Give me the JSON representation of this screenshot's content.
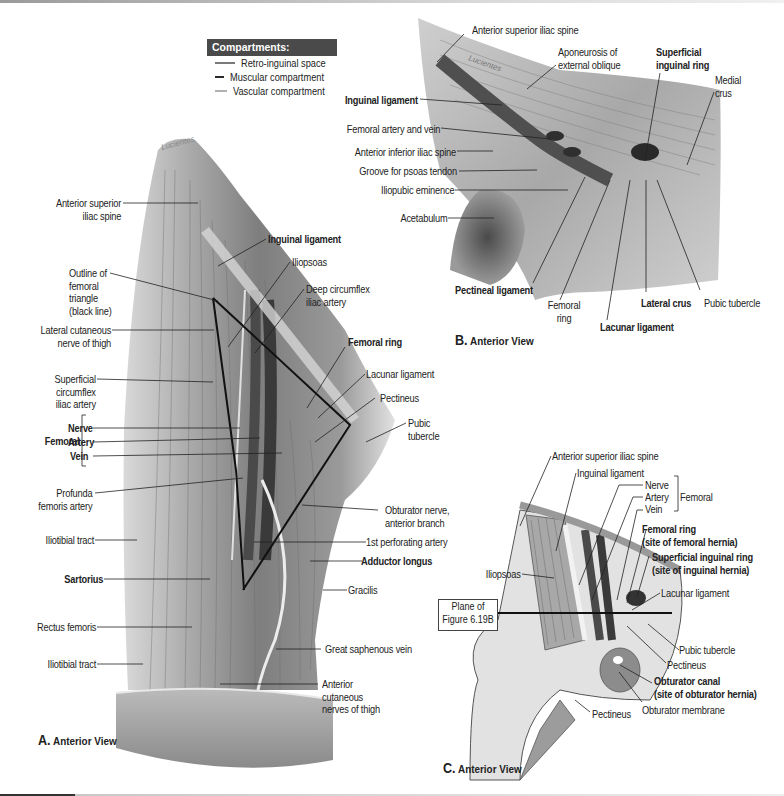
{
  "legend": {
    "title": "Compartments:",
    "items": [
      {
        "label": "Retro-inguinal space",
        "color": "#7a7a7a"
      },
      {
        "label": "Muscular compartment",
        "color": "#2a2a2a"
      },
      {
        "label": "Vascular compartment",
        "color": "#b0b0b0"
      }
    ]
  },
  "panel_a": {
    "caption_letter": "A.",
    "caption_text": "Anterior View",
    "labels_left": [
      {
        "text": "Anterior superior",
        "text2": "iliac spine"
      },
      {
        "text": "Outline of",
        "text2": "femoral",
        "text3": "triangle",
        "text4": "(black line)"
      },
      {
        "text": "Lateral cutaneous",
        "text2": "nerve of thigh"
      },
      {
        "text": "Superficial",
        "text2": "circumflex",
        "text3": "iliac artery"
      },
      {
        "text": "Profunda",
        "text2": "femoris artery"
      },
      {
        "text": "Iliotibial tract"
      },
      {
        "text": "Sartorius"
      },
      {
        "text": "Rectus femoris"
      },
      {
        "text": "Iliotibial tract"
      }
    ],
    "femoral_group": {
      "title": "Femoral",
      "nerve": "Nerve",
      "artery": "Artery",
      "vein": "Vein"
    },
    "labels_right": [
      {
        "text": "Inguinal ligament"
      },
      {
        "text": "Iliopsoas"
      },
      {
        "text": "Deep circumflex",
        "text2": "iliac artery"
      },
      {
        "text": "Femoral ring"
      },
      {
        "text": "Lacunar ligament"
      },
      {
        "text": "Pectineus"
      },
      {
        "text": "Pubic",
        "text2": "tubercle"
      },
      {
        "text": "Obturator nerve,",
        "text2": "anterior branch"
      },
      {
        "text": "1st perforating artery"
      },
      {
        "text": "Adductor longus"
      },
      {
        "text": "Gracilis"
      },
      {
        "text": "Great saphenous vein"
      },
      {
        "text": "Anterior",
        "text2": "cutaneous",
        "text3": "nerves of thigh"
      }
    ]
  },
  "panel_b": {
    "caption_letter": "B.",
    "caption_text": "Anterior View",
    "labels": [
      {
        "text": "Anterior superior iliac spine"
      },
      {
        "text": "Aponeurosis of",
        "text2": "external oblique"
      },
      {
        "text": "Superficial",
        "text2": "inguinal ring"
      },
      {
        "text": "Medial",
        "text2": "crus"
      },
      {
        "text": "Inguinal ligament"
      },
      {
        "text": "Femoral artery and vein"
      },
      {
        "text": "Anterior inferior iliac spine"
      },
      {
        "text": "Groove for psoas tendon"
      },
      {
        "text": "Iliopubic eminence"
      },
      {
        "text": "Acetabulum"
      },
      {
        "text": "Pectineal ligament"
      },
      {
        "text": "Femoral",
        "text2": "ring"
      },
      {
        "text": "Lacunar ligament"
      },
      {
        "text": "Lateral crus"
      },
      {
        "text": "Pubic tubercle"
      }
    ]
  },
  "panel_c": {
    "caption_letter": "C.",
    "caption_text": "Anterior View",
    "plane_box": {
      "line1": "Plane of",
      "line2": "Figure 6.19B"
    },
    "femoral_group": {
      "title": "Femoral",
      "nerve": "Nerve",
      "artery": "Artery",
      "vein": "Vein"
    },
    "labels": [
      {
        "text": "Anterior superior iliac spine"
      },
      {
        "text": "Inguinal ligament"
      },
      {
        "text": "Femoral ring",
        "text2": "(site of femoral hernia)"
      },
      {
        "text": "Superficial inguinal ring",
        "text2": "(site of inguinal hernia)"
      },
      {
        "text": "Iliopsoas"
      },
      {
        "text": "Lacunar ligament"
      },
      {
        "text": "Pubic tubercle"
      },
      {
        "text": "Pectineus"
      },
      {
        "text": "Obturator canal",
        "text2": "(site of obturator hernia)"
      },
      {
        "text": "Obturator membrane"
      },
      {
        "text": "Pectineus"
      }
    ]
  }
}
